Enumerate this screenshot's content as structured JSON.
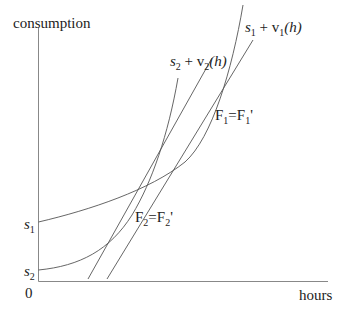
{
  "diagram": {
    "type": "economics-graph",
    "y_axis_label": "consumption",
    "x_axis_label": "hours",
    "origin_label": "0",
    "y_ticks": [
      {
        "base": "s",
        "sub": "1"
      },
      {
        "base": "s",
        "sub": "2"
      }
    ],
    "curves": [
      {
        "id": "curve1",
        "label_base": "s",
        "label_sub": "1",
        "label_rest": " + v",
        "label_v_sub": "1",
        "label_arg": "(h)"
      },
      {
        "id": "curve2",
        "label_base": "s",
        "label_sub": "2",
        "label_rest": " + v",
        "label_v_sub": "2",
        "label_arg": "(h)"
      }
    ],
    "lines": [
      {
        "id": "F1",
        "label_a": "F",
        "label_a_sub": "1",
        "label_eq": "=",
        "label_b": "F",
        "label_b_sub": "1",
        "label_prime": "'"
      },
      {
        "id": "F2",
        "label_a": "F",
        "label_a_sub": "2",
        "label_eq": "=",
        "label_b": "F",
        "label_b_sub": "2",
        "label_prime": "'"
      }
    ],
    "colors": {
      "axis": "#888888",
      "curve": "#555555",
      "text": "#222222",
      "background": "#ffffff"
    }
  }
}
